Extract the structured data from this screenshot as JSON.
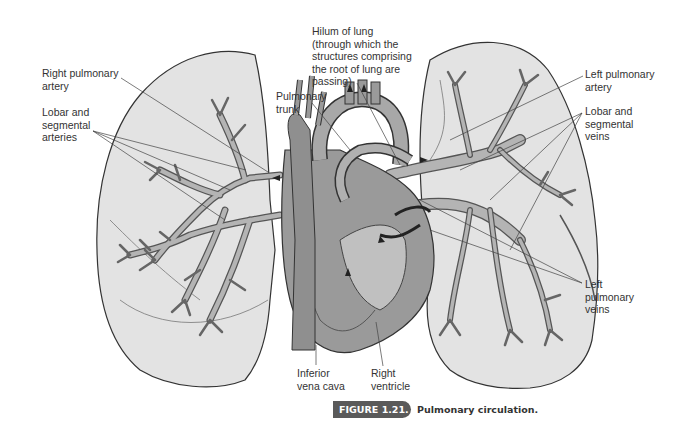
{
  "figure": {
    "number_label": "FIGURE 1.21.",
    "caption": "Pulmonary circulation.",
    "colors": {
      "lung_fill": "#e3e3e3",
      "vessel_fill": "#b4b4b4",
      "vessel_stroke": "#555555",
      "heart_fill": "#9a9a9a",
      "leader_line": "#444444",
      "badge": "#5a5a5a"
    }
  },
  "labels": {
    "right_pulmonary_artery": "Right pulmonary\nartery",
    "lobar_segmental_arteries": "Lobar and\nsegmental\narteries",
    "pulmonary_trunk": "Pulmonary\ntrunk",
    "hilum_of_lung": "Hilum of lung\n(through which the\nstructures comprising\nthe root of lung are\npassing)",
    "left_pulmonary_artery": "Left pulmonary\nartery",
    "lobar_segmental_veins": "Lobar and\nsegmental\nveins",
    "left_pulmonary_veins": "Left\npulmonary\nveins",
    "inferior_vena_cava": "Inferior\nvena cava",
    "right_ventricle": "Right\nventricle"
  }
}
